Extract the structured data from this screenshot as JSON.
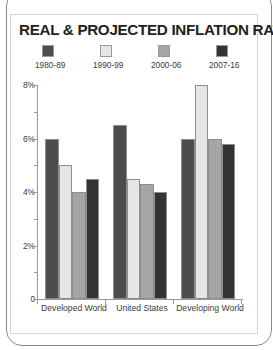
{
  "card": {
    "title": "REAL & PROJECTED INFLATION RATES"
  },
  "colors": {
    "series_1980_89": "#4d4d4d",
    "series_1990_99": "#e6e6e6",
    "series_2000_06": "#a5a5a5",
    "series_2007_16": "#333333",
    "axis": "#9a9a9a",
    "text": "#3b3b3b",
    "title_text": "#231f20",
    "card_border": "#d8d8d8",
    "page_border": "#8a8a8a",
    "background": "#ffffff"
  },
  "chart_data": {
    "type": "bar",
    "title": "REAL & PROJECTED INFLATION RATES",
    "xlabel": "",
    "ylabel": "",
    "categories": [
      "Developed World",
      "United States",
      "Developing World"
    ],
    "series": [
      {
        "name": "1980-89",
        "color": "#4d4d4d",
        "values": [
          6.0,
          6.5,
          6.0
        ]
      },
      {
        "name": "1990-99",
        "color": "#e6e6e6",
        "values": [
          5.0,
          4.5,
          8.0
        ]
      },
      {
        "name": "2000-06",
        "color": "#a5a5a5",
        "values": [
          4.0,
          4.3,
          6.0
        ]
      },
      {
        "name": "2007-16",
        "color": "#333333",
        "values": [
          4.5,
          4.0,
          5.8
        ]
      }
    ],
    "ylim": [
      0,
      8
    ],
    "yticks": [
      0,
      2,
      4,
      6,
      8
    ],
    "ytick_labels": [
      "0",
      "2%",
      "4%",
      "6%",
      "8%"
    ],
    "yminor_ticks": [
      1,
      3,
      5,
      7
    ],
    "grid": false,
    "legend_position": "top"
  }
}
